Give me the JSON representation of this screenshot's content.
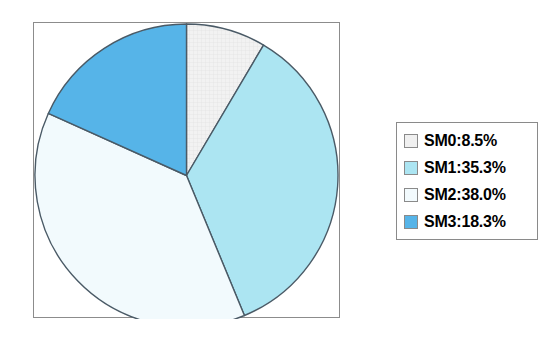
{
  "chart_data": {
    "type": "pie",
    "title": "",
    "xlabel": "",
    "ylabel": "",
    "labels": [
      "SM0",
      "SM1",
      "SM2",
      "SM3"
    ],
    "values": [
      8.5,
      35.3,
      38.0,
      18.3
    ],
    "value_unit": "%",
    "start_angle_deg": 90,
    "direction": "clockwise",
    "grid": false,
    "legend_position": "right",
    "frame": true,
    "slices": [
      {
        "name": "SM0",
        "value": 8.5,
        "legend_text": "SM0:8.5%",
        "color": "#f0f0f0",
        "edge_color": "#4a5a66",
        "texture": "fine-grid"
      },
      {
        "name": "SM1",
        "value": 35.3,
        "legend_text": "SM1:35.3%",
        "color": "#ace5f2",
        "edge_color": "#4a5a66",
        "texture": "none"
      },
      {
        "name": "SM2",
        "value": 38.0,
        "legend_text": "SM2:38.0%",
        "color": "#f2fafd",
        "edge_color": "#4a5a66",
        "texture": "none"
      },
      {
        "name": "SM3",
        "value": 18.3,
        "legend_text": "SM3:18.3%",
        "color": "#56b4e8",
        "edge_color": "#4a5a66",
        "texture": "none"
      }
    ]
  },
  "legend": {
    "items": [
      {
        "label": "SM0:8.5%",
        "color": "#f0f0f0"
      },
      {
        "label": "SM1:35.3%",
        "color": "#ace5f2"
      },
      {
        "label": "SM2:38.0%",
        "color": "#f2fafd"
      },
      {
        "label": "SM3:18.3%",
        "color": "#56b4e8"
      }
    ],
    "border_color": "#8a8a8a",
    "background": "#ffffff"
  },
  "figure": {
    "background": "#ffffff",
    "frame_color": "#8c8c8c"
  }
}
